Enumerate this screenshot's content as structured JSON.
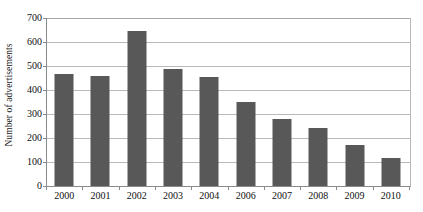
{
  "chart_data": {
    "type": "bar",
    "title": "",
    "xlabel": "",
    "ylabel": "Number of advertisements",
    "categories": [
      "2000",
      "2001",
      "2002",
      "2003",
      "2004",
      "2006",
      "2007",
      "2008",
      "2009",
      "2010"
    ],
    "values": [
      465,
      458,
      645,
      488,
      455,
      350,
      278,
      243,
      170,
      118
    ],
    "series": [
      {
        "name": "Number of advertisements",
        "values": [
          465,
          458,
          645,
          488,
          455,
          350,
          278,
          243,
          170,
          118
        ]
      }
    ],
    "ylim": [
      0,
      700
    ],
    "ytick_step": 100,
    "yticks": [
      "0",
      "100",
      "200",
      "300",
      "400",
      "500",
      "600",
      "700"
    ],
    "grid": "horizontal",
    "legend": "none",
    "bar_color": "#585858",
    "gridline_color": "#b9b9b9",
    "axis_color": "#8a8a8a",
    "background_color": "#ffffff"
  }
}
